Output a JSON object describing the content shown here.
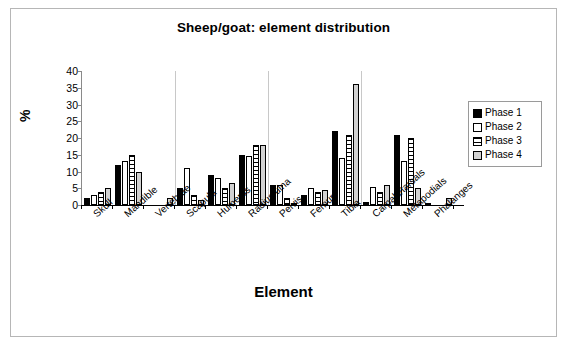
{
  "figure": {
    "title": "Sheep/goat: element distribution",
    "xlabel": "Element",
    "ylabel": "%"
  },
  "legend": {
    "items": [
      {
        "label": "Phase 1",
        "swatch": "solid-black"
      },
      {
        "label": "Phase 2",
        "swatch": "white"
      },
      {
        "label": "Phase 3",
        "swatch": "horizontal-hatch"
      },
      {
        "label": "Phase 4",
        "swatch": "light-gray"
      }
    ]
  },
  "axis": {
    "yticks": [
      "40",
      "35",
      "30",
      "25",
      "20",
      "15",
      "10",
      "5",
      "0"
    ]
  },
  "chart_data": {
    "type": "bar",
    "title": "Sheep/goat: element distribution",
    "xlabel": "Element",
    "ylabel": "%",
    "ylim": [
      0,
      40
    ],
    "ytick_step": 5,
    "grid": false,
    "legend_position": "right",
    "categories": [
      "Skull",
      "Mandible",
      "Vertebrae",
      "Scapula",
      "Humerus",
      "Radius/ulna",
      "Pelvis",
      "Femur",
      "Tibia",
      "Carpals/tarsals",
      "Metapodials",
      "Phalanges"
    ],
    "series": [
      {
        "name": "Phase 1",
        "color": "#000000",
        "values": [
          2,
          12,
          0,
          5,
          9,
          15,
          6,
          3,
          22,
          1,
          21,
          0.5
        ]
      },
      {
        "name": "Phase 2",
        "color": "#ffffff",
        "values": [
          3,
          13,
          0,
          11,
          8,
          14.5,
          6,
          5,
          14,
          5.5,
          13,
          0
        ]
      },
      {
        "name": "Phase 3",
        "color": "#ffffff",
        "values": [
          4,
          15,
          0,
          3,
          5,
          18,
          2,
          4,
          21,
          4,
          20,
          0
        ]
      },
      {
        "name": "Phase 4",
        "color": "#d2d2d2",
        "values": [
          5,
          10,
          2,
          1.5,
          6.5,
          18,
          0.5,
          4.5,
          36,
          6,
          5,
          2
        ]
      }
    ]
  }
}
